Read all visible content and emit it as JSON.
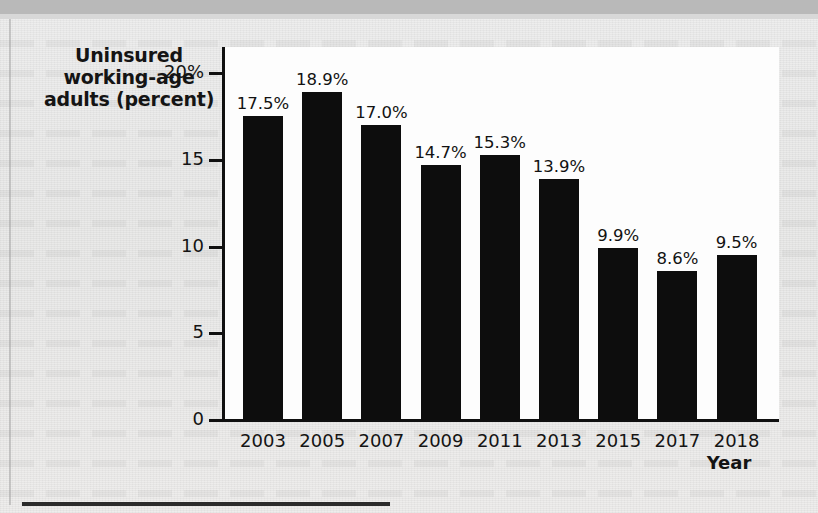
{
  "figure": {
    "background_color": "#ececeb",
    "plot_background_color": "#fdfdfd",
    "bar_color": "#0d0d0d",
    "axis_color": "#101010",
    "y_axis_title_lines": [
      "Uninsured",
      "working-age",
      "adults (percent)"
    ],
    "x_axis_title": "Year"
  },
  "chart_data": {
    "type": "bar",
    "title": "",
    "xlabel": "Year",
    "ylabel": "Uninsured working-age adults (percent)",
    "categories": [
      "2003",
      "2005",
      "2007",
      "2009",
      "2011",
      "2013",
      "2015",
      "2017",
      "2018"
    ],
    "values": [
      17.5,
      18.9,
      17.0,
      14.7,
      15.3,
      13.9,
      9.9,
      8.6,
      9.5
    ],
    "value_labels": [
      "17.5%",
      "18.9%",
      "17.0%",
      "14.7%",
      "15.3%",
      "13.9%",
      "9.9%",
      "8.6%",
      "9.5%"
    ],
    "ylim": [
      0,
      21.5
    ],
    "yticks": [
      0,
      5,
      10,
      15,
      20
    ],
    "ytick_labels": [
      "0",
      "5",
      "10",
      "15",
      "20%"
    ],
    "grid": false,
    "legend": false
  }
}
